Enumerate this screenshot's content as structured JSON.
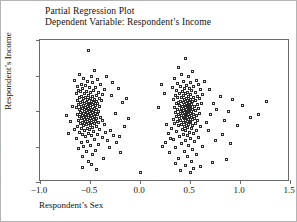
{
  "titles": {
    "line1": "Partial Regression Plot",
    "line2": "Dependent Variable: Respondent’s Income"
  },
  "chart_data": {
    "type": "scatter",
    "title": "Partial Regression Plot",
    "subtitle": "Dependent Variable: Respondent’s Income",
    "xlabel": "Respondent’s Sex",
    "ylabel": "Respondent’s Income",
    "xlim": [
      -1.0,
      1.5
    ],
    "ylim": [
      -20,
      20
    ],
    "xticks": [
      -1.0,
      -0.5,
      0.0,
      0.5,
      1.0,
      1.5
    ],
    "xticklabels": [
      "−1.0",
      "−0.5",
      "0.0",
      "0.5",
      "1.0",
      "1.5"
    ],
    "yticks": [
      20,
      10,
      0,
      -10,
      -20
    ],
    "yticklabels": [
      "20",
      "10",
      "0",
      "−10",
      "−20"
    ],
    "grid": false,
    "legend": null,
    "marker": "open-square",
    "marker_color": "#2b2b2b",
    "points": [
      [
        -0.52,
        17.1
      ],
      [
        -0.46,
        11.3
      ],
      [
        -0.61,
        10.4
      ],
      [
        -0.49,
        9.8
      ],
      [
        -0.57,
        9.2
      ],
      [
        -0.43,
        8.9
      ],
      [
        -0.66,
        8.5
      ],
      [
        -0.53,
        8.2
      ],
      [
        -0.48,
        7.9
      ],
      [
        -0.59,
        7.6
      ],
      [
        -0.4,
        7.4
      ],
      [
        -0.55,
        7.1
      ],
      [
        -0.63,
        6.9
      ],
      [
        -0.45,
        6.7
      ],
      [
        -0.51,
        6.5
      ],
      [
        -0.58,
        6.3
      ],
      [
        -0.36,
        6.1
      ],
      [
        -0.62,
        5.9
      ],
      [
        -0.47,
        5.7
      ],
      [
        -0.54,
        5.6
      ],
      [
        -0.6,
        5.4
      ],
      [
        -0.42,
        5.2
      ],
      [
        -0.5,
        5.1
      ],
      [
        -0.56,
        4.9
      ],
      [
        -0.64,
        4.8
      ],
      [
        -0.38,
        4.6
      ],
      [
        -0.52,
        4.5
      ],
      [
        -0.44,
        4.3
      ],
      [
        -0.59,
        4.2
      ],
      [
        -0.48,
        4.0
      ],
      [
        -0.55,
        3.9
      ],
      [
        -0.61,
        3.8
      ],
      [
        -0.41,
        3.6
      ],
      [
        -0.5,
        3.5
      ],
      [
        -0.57,
        3.4
      ],
      [
        -0.46,
        3.2
      ],
      [
        -0.53,
        3.1
      ],
      [
        -0.63,
        3.0
      ],
      [
        -0.39,
        2.9
      ],
      [
        -0.49,
        2.8
      ],
      [
        -0.58,
        2.7
      ],
      [
        -0.44,
        2.6
      ],
      [
        -0.54,
        2.5
      ],
      [
        -0.6,
        2.4
      ],
      [
        -0.47,
        2.3
      ],
      [
        -0.51,
        2.2
      ],
      [
        -0.56,
        2.1
      ],
      [
        -0.43,
        2.0
      ],
      [
        -0.62,
        1.9
      ],
      [
        -0.52,
        1.8
      ],
      [
        -0.48,
        1.7
      ],
      [
        -0.57,
        1.6
      ],
      [
        -0.45,
        1.5
      ],
      [
        -0.53,
        1.4
      ],
      [
        -0.59,
        1.3
      ],
      [
        -0.41,
        1.2
      ],
      [
        -0.5,
        1.1
      ],
      [
        -0.55,
        1.0
      ],
      [
        -0.64,
        0.9
      ],
      [
        -0.46,
        0.8
      ],
      [
        -0.52,
        0.7
      ],
      [
        -0.58,
        0.6
      ],
      [
        -0.44,
        0.5
      ],
      [
        -0.49,
        0.4
      ],
      [
        -0.61,
        0.3
      ],
      [
        -0.54,
        0.2
      ],
      [
        -0.47,
        0.1
      ],
      [
        -0.56,
        0.0
      ],
      [
        -0.51,
        -0.1
      ],
      [
        -0.42,
        -0.2
      ],
      [
        -0.6,
        -0.3
      ],
      [
        -0.48,
        -0.4
      ],
      [
        -0.53,
        -0.5
      ],
      [
        -0.57,
        -0.6
      ],
      [
        -0.45,
        -0.7
      ],
      [
        -0.5,
        -0.8
      ],
      [
        -0.63,
        -0.9
      ],
      [
        -0.55,
        -1.0
      ],
      [
        -0.43,
        -1.1
      ],
      [
        -0.58,
        -1.2
      ],
      [
        -0.49,
        -1.3
      ],
      [
        -0.52,
        -1.4
      ],
      [
        -0.46,
        -1.5
      ],
      [
        -0.61,
        -1.6
      ],
      [
        -0.54,
        -1.7
      ],
      [
        -0.4,
        -1.8
      ],
      [
        -0.57,
        -1.9
      ],
      [
        -0.5,
        -2.0
      ],
      [
        -0.44,
        -2.1
      ],
      [
        -0.59,
        -2.2
      ],
      [
        -0.53,
        -2.3
      ],
      [
        -0.47,
        -2.4
      ],
      [
        -0.56,
        -2.5
      ],
      [
        -0.38,
        -2.6
      ],
      [
        -0.51,
        -2.7
      ],
      [
        -0.62,
        -2.8
      ],
      [
        -0.45,
        -2.9
      ],
      [
        -0.55,
        -3.0
      ],
      [
        -0.49,
        -3.1
      ],
      [
        -0.58,
        -3.2
      ],
      [
        -0.42,
        -3.3
      ],
      [
        -0.52,
        -3.4
      ],
      [
        -0.6,
        -3.5
      ],
      [
        -0.46,
        -3.6
      ],
      [
        -0.54,
        -3.8
      ],
      [
        -0.36,
        -3.9
      ],
      [
        -0.5,
        -4.0
      ],
      [
        -0.57,
        -4.2
      ],
      [
        -0.44,
        -4.3
      ],
      [
        -0.63,
        -4.5
      ],
      [
        -0.48,
        -4.6
      ],
      [
        -0.53,
        -4.8
      ],
      [
        -0.59,
        -5.0
      ],
      [
        -0.41,
        -5.1
      ],
      [
        -0.51,
        -5.3
      ],
      [
        -0.3,
        -5.4
      ],
      [
        -0.56,
        -5.6
      ],
      [
        -0.47,
        -5.8
      ],
      [
        -0.61,
        -6.0
      ],
      [
        -0.35,
        -6.1
      ],
      [
        -0.52,
        -6.3
      ],
      [
        -0.43,
        -6.5
      ],
      [
        -0.58,
        -6.7
      ],
      [
        -0.27,
        -6.8
      ],
      [
        -0.49,
        -7.0
      ],
      [
        -0.55,
        -7.3
      ],
      [
        -0.38,
        -7.5
      ],
      [
        -0.64,
        -7.7
      ],
      [
        -0.46,
        -8.0
      ],
      [
        -0.33,
        -8.2
      ],
      [
        -0.53,
        -8.5
      ],
      [
        -0.59,
        -8.8
      ],
      [
        -0.24,
        -9.0
      ],
      [
        -0.42,
        -9.3
      ],
      [
        -0.5,
        -9.6
      ],
      [
        -0.57,
        -9.9
      ],
      [
        -0.31,
        -10.2
      ],
      [
        -0.62,
        -10.6
      ],
      [
        -0.45,
        -11.0
      ],
      [
        -0.54,
        -11.4
      ],
      [
        -0.2,
        -11.8
      ],
      [
        -0.48,
        -12.3
      ],
      [
        -0.58,
        -12.9
      ],
      [
        -0.37,
        -13.4
      ],
      [
        -0.52,
        -14.1
      ],
      [
        -0.66,
        -5.2
      ],
      [
        -0.7,
        -3.0
      ],
      [
        -0.72,
        -6.4
      ],
      [
        -0.68,
        1.2
      ],
      [
        -0.74,
        -1.4
      ],
      [
        -0.29,
        4.4
      ],
      [
        -0.22,
        6.2
      ],
      [
        -0.18,
        2.4
      ],
      [
        -0.25,
        -0.6
      ],
      [
        -0.14,
        3.4
      ],
      [
        -0.34,
        9.6
      ],
      [
        -0.28,
        8.1
      ],
      [
        -0.16,
        -4.4
      ],
      [
        -0.12,
        -2.2
      ],
      [
        -0.21,
        -7.2
      ],
      [
        -0.49,
        -15.2
      ],
      [
        -0.58,
        -16.0
      ],
      [
        -0.44,
        -16.6
      ],
      [
        0.0,
        -17.4
      ],
      [
        0.45,
        14.9
      ],
      [
        0.38,
        12.2
      ],
      [
        0.52,
        11.0
      ],
      [
        0.41,
        10.2
      ],
      [
        0.48,
        9.6
      ],
      [
        0.34,
        9.1
      ],
      [
        0.56,
        8.7
      ],
      [
        0.43,
        8.4
      ],
      [
        0.5,
        8.0
      ],
      [
        0.37,
        7.8
      ],
      [
        0.58,
        7.5
      ],
      [
        0.46,
        7.2
      ],
      [
        0.4,
        7.0
      ],
      [
        0.53,
        6.8
      ],
      [
        0.32,
        6.6
      ],
      [
        0.49,
        6.4
      ],
      [
        0.44,
        6.2
      ],
      [
        0.6,
        6.0
      ],
      [
        0.36,
        5.8
      ],
      [
        0.51,
        5.7
      ],
      [
        0.42,
        5.5
      ],
      [
        0.47,
        5.3
      ],
      [
        0.55,
        5.2
      ],
      [
        0.39,
        5.0
      ],
      [
        0.45,
        4.9
      ],
      [
        0.62,
        4.7
      ],
      [
        0.5,
        4.6
      ],
      [
        0.35,
        4.4
      ],
      [
        0.43,
        4.3
      ],
      [
        0.57,
        4.2
      ],
      [
        0.48,
        4.0
      ],
      [
        0.41,
        3.9
      ],
      [
        0.53,
        3.8
      ],
      [
        0.37,
        3.7
      ],
      [
        0.46,
        3.5
      ],
      [
        0.59,
        3.4
      ],
      [
        0.44,
        3.3
      ],
      [
        0.5,
        3.2
      ],
      [
        0.33,
        3.1
      ],
      [
        0.47,
        3.0
      ],
      [
        0.55,
        2.9
      ],
      [
        0.4,
        2.8
      ],
      [
        0.45,
        2.7
      ],
      [
        0.52,
        2.6
      ],
      [
        0.38,
        2.5
      ],
      [
        0.49,
        2.4
      ],
      [
        0.43,
        2.3
      ],
      [
        0.61,
        2.2
      ],
      [
        0.46,
        2.1
      ],
      [
        0.36,
        2.0
      ],
      [
        0.51,
        1.9
      ],
      [
        0.44,
        1.8
      ],
      [
        0.57,
        1.7
      ],
      [
        0.48,
        1.6
      ],
      [
        0.39,
        1.5
      ],
      [
        0.42,
        1.4
      ],
      [
        0.54,
        1.3
      ],
      [
        0.47,
        1.2
      ],
      [
        0.34,
        1.1
      ],
      [
        0.5,
        1.0
      ],
      [
        0.45,
        0.9
      ],
      [
        0.58,
        0.8
      ],
      [
        0.41,
        0.7
      ],
      [
        0.49,
        0.6
      ],
      [
        0.37,
        0.5
      ],
      [
        0.52,
        0.4
      ],
      [
        0.46,
        0.3
      ],
      [
        0.43,
        0.2
      ],
      [
        0.55,
        0.1
      ],
      [
        0.48,
        0.0
      ],
      [
        0.4,
        -0.1
      ],
      [
        0.51,
        -0.2
      ],
      [
        0.44,
        -0.3
      ],
      [
        0.35,
        -0.4
      ],
      [
        0.47,
        -0.5
      ],
      [
        0.59,
        -0.6
      ],
      [
        0.42,
        -0.7
      ],
      [
        0.5,
        -0.8
      ],
      [
        0.45,
        -0.9
      ],
      [
        0.38,
        -1.0
      ],
      [
        0.53,
        -1.1
      ],
      [
        0.46,
        -1.2
      ],
      [
        0.41,
        -1.3
      ],
      [
        0.56,
        -1.4
      ],
      [
        0.49,
        -1.5
      ],
      [
        0.36,
        -1.6
      ],
      [
        0.43,
        -1.7
      ],
      [
        0.51,
        -1.8
      ],
      [
        0.47,
        -1.9
      ],
      [
        0.39,
        -2.0
      ],
      [
        0.54,
        -2.1
      ],
      [
        0.44,
        -2.2
      ],
      [
        0.48,
        -2.3
      ],
      [
        0.33,
        -2.4
      ],
      [
        0.52,
        -2.5
      ],
      [
        0.45,
        -2.6
      ],
      [
        0.4,
        -2.7
      ],
      [
        0.57,
        -2.8
      ],
      [
        0.49,
        -2.9
      ],
      [
        0.37,
        -3.0
      ],
      [
        0.43,
        -3.1
      ],
      [
        0.5,
        -3.2
      ],
      [
        0.46,
        -3.4
      ],
      [
        0.34,
        -3.5
      ],
      [
        0.55,
        -3.6
      ],
      [
        0.41,
        -3.7
      ],
      [
        0.48,
        -3.9
      ],
      [
        0.52,
        -4.0
      ],
      [
        0.38,
        -4.2
      ],
      [
        0.44,
        -4.3
      ],
      [
        0.6,
        -4.5
      ],
      [
        0.47,
        -4.6
      ],
      [
        0.31,
        -4.8
      ],
      [
        0.51,
        -5.0
      ],
      [
        0.42,
        -5.2
      ],
      [
        0.45,
        -5.4
      ],
      [
        0.56,
        -5.6
      ],
      [
        0.36,
        -5.8
      ],
      [
        0.49,
        -6.0
      ],
      [
        0.28,
        -6.2
      ],
      [
        0.53,
        -6.4
      ],
      [
        0.43,
        -6.6
      ],
      [
        0.47,
        -6.9
      ],
      [
        0.39,
        -7.1
      ],
      [
        0.58,
        -7.4
      ],
      [
        0.5,
        -7.7
      ],
      [
        0.33,
        -8.0
      ],
      [
        0.45,
        -8.3
      ],
      [
        0.54,
        -8.6
      ],
      [
        0.25,
        -8.9
      ],
      [
        0.41,
        -9.2
      ],
      [
        0.48,
        -9.6
      ],
      [
        0.62,
        -10.0
      ],
      [
        0.35,
        -10.4
      ],
      [
        0.52,
        -10.8
      ],
      [
        0.44,
        -11.3
      ],
      [
        0.29,
        -11.8
      ],
      [
        0.56,
        -12.3
      ],
      [
        0.47,
        -12.9
      ],
      [
        0.38,
        -13.5
      ],
      [
        0.51,
        -14.2
      ],
      [
        0.66,
        -3.3
      ],
      [
        0.7,
        -1.1
      ],
      [
        0.73,
        2.1
      ],
      [
        0.68,
        -5.5
      ],
      [
        0.76,
        0.4
      ],
      [
        0.8,
        4.2
      ],
      [
        0.84,
        -2.6
      ],
      [
        0.88,
        -0.2
      ],
      [
        0.92,
        3.1
      ],
      [
        0.97,
        -4.0
      ],
      [
        1.02,
        1.5
      ],
      [
        1.1,
        -1.9
      ],
      [
        0.21,
        7.4
      ],
      [
        0.24,
        5.0
      ],
      [
        0.18,
        1.0
      ],
      [
        0.26,
        -3.7
      ],
      [
        0.3,
        -7.8
      ],
      [
        0.22,
        -9.9
      ],
      [
        0.64,
        8.3
      ],
      [
        0.69,
        6.1
      ],
      [
        0.75,
        -8.4
      ],
      [
        0.82,
        -6.6
      ],
      [
        0.9,
        -9.1
      ],
      [
        1.18,
        -0.9
      ],
      [
        1.26,
        2.8
      ],
      [
        0.45,
        -15.3
      ],
      [
        0.53,
        -16.1
      ],
      [
        0.4,
        -16.8
      ],
      [
        0.6,
        -15.7
      ],
      [
        0.72,
        -14.4
      ],
      [
        0.86,
        -13.8
      ],
      [
        0.5,
        -17.2
      ],
      [
        0.35,
        -14.9
      ]
    ]
  },
  "axis_titles": {
    "x": "Respondent’s Sex",
    "y": "Respondent’s Income"
  }
}
